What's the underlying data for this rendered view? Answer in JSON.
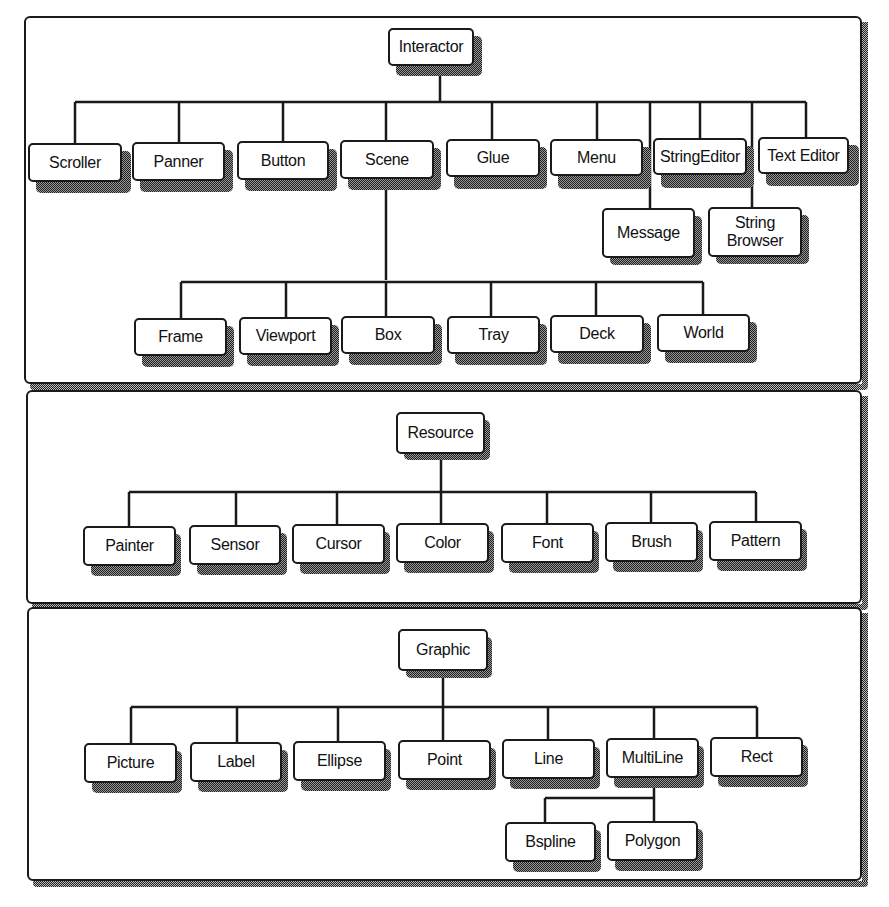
{
  "diagram": {
    "type": "class-hierarchy",
    "panels": [
      {
        "id": "interactor",
        "root": "Interactor",
        "children": [
          "Scroller",
          "Panner",
          "Button",
          "Scene",
          "Glue",
          "Menu",
          "StringEditor",
          "Text Editor"
        ],
        "sub_children": [
          {
            "label": "Message",
            "connected_via": "trunk-line"
          },
          {
            "label": "String Browser",
            "connected_via": "trunk-line"
          }
        ],
        "scene_children": [
          "Frame",
          "Viewport",
          "Box",
          "Tray",
          "Deck",
          "World"
        ]
      },
      {
        "id": "resource",
        "root": "Resource",
        "children": [
          "Painter",
          "Sensor",
          "Cursor",
          "Color",
          "Font",
          "Brush",
          "Pattern"
        ]
      },
      {
        "id": "graphic",
        "root": "Graphic",
        "children": [
          "Picture",
          "Label",
          "Ellipse",
          "Point",
          "Line",
          "MultiLine",
          "Rect"
        ],
        "multiline_children": [
          "Bspline",
          "Polygon"
        ]
      }
    ]
  },
  "nodes": {
    "interactor": "Interactor",
    "scroller": "Scroller",
    "panner": "Panner",
    "button": "Button",
    "scene": "Scene",
    "glue": "Glue",
    "menu": "Menu",
    "stringeditor": "StringEditor",
    "texteditor": "Text Editor",
    "message": "Message",
    "stringbrowser_1": "String",
    "stringbrowser_2": "Browser",
    "frame": "Frame",
    "viewport": "Viewport",
    "box": "Box",
    "tray": "Tray",
    "deck": "Deck",
    "world": "World",
    "resource": "Resource",
    "painter": "Painter",
    "sensor": "Sensor",
    "cursor": "Cursor",
    "color": "Color",
    "font": "Font",
    "brush": "Brush",
    "pattern": "Pattern",
    "graphic": "Graphic",
    "picture": "Picture",
    "label": "Label",
    "ellipse": "Ellipse",
    "point": "Point",
    "line": "Line",
    "multiline": "MultiLine",
    "rect": "Rect",
    "bspline": "Bspline",
    "polygon": "Polygon"
  },
  "colors": {
    "ink": "#1a1a1a",
    "background": "#ffffff",
    "shadow_dither_dark": "#1e1e1e",
    "shadow_dither_light": "#9a9a9a"
  }
}
